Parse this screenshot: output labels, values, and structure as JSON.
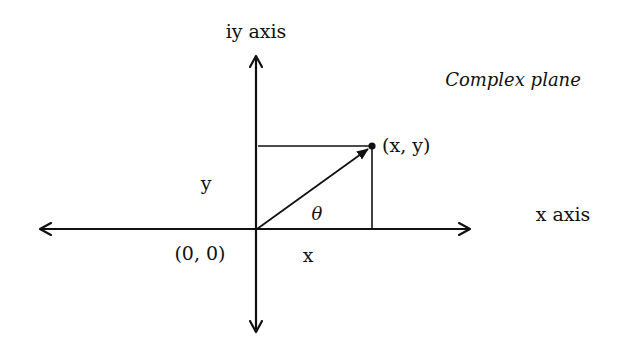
{
  "title": "Complex plane",
  "axes": {
    "y_label": "iy axis",
    "x_label": "x axis",
    "origin_label": "(0, 0)"
  },
  "point": {
    "label": "(x, y)"
  },
  "components": {
    "x_label": "x",
    "y_label": "y",
    "angle_label": "θ"
  },
  "colors": {
    "stroke": "#111111",
    "background": "#ffffff"
  }
}
